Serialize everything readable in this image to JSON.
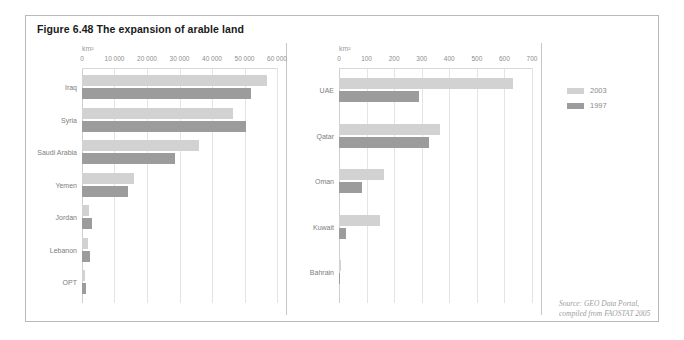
{
  "figure": {
    "title": "Figure 6.48 The expansion of arable land",
    "source_line1": "Source: GEO Data Portal,",
    "source_line2": "compiled from FAOSTAT 2005"
  },
  "legend": {
    "items": [
      {
        "label": "2003",
        "color": "#d2d2d2"
      },
      {
        "label": "1997",
        "color": "#9c9c9c"
      }
    ]
  },
  "chart_data": [
    {
      "type": "bar",
      "orientation": "horizontal",
      "title": "Figure 6.48 The expansion of arable land",
      "panel": "left",
      "xlabel": "km2",
      "unit_label": "km²",
      "ylabel": "",
      "xlim": [
        0,
        60000
      ],
      "ticks": [
        0,
        10000,
        20000,
        30000,
        40000,
        50000,
        60000
      ],
      "tick_labels": [
        "0",
        "10 000",
        "20 000",
        "30 000",
        "40 000",
        "50 000",
        "60 000"
      ],
      "grid": true,
      "legend_position": "right-outside",
      "categories": [
        "Iraq",
        "Syria",
        "Saudi Arabia",
        "Yemen",
        "Jordan",
        "Lebanon",
        "OPT"
      ],
      "series": [
        {
          "name": "2003",
          "color": "#d2d2d2",
          "values": [
            57000,
            46500,
            36000,
            16000,
            2000,
            1800,
            800
          ]
        },
        {
          "name": "1997",
          "color": "#9c9c9c",
          "values": [
            52000,
            50500,
            28500,
            14000,
            3000,
            2500,
            1200
          ]
        }
      ]
    },
    {
      "type": "bar",
      "orientation": "horizontal",
      "panel": "right",
      "xlabel": "km2",
      "unit_label": "km²",
      "ylabel": "",
      "xlim": [
        0,
        700
      ],
      "ticks": [
        0,
        100,
        200,
        300,
        400,
        500,
        600,
        700
      ],
      "tick_labels": [
        "0",
        "100",
        "200",
        "300",
        "400",
        "500",
        "600",
        "700"
      ],
      "grid": true,
      "legend_position": "right-outside",
      "categories": [
        "UAE",
        "Qatar",
        "Oman",
        "Kuwait",
        "Bahrain"
      ],
      "series": [
        {
          "name": "2003",
          "color": "#d2d2d2",
          "values": [
            630,
            365,
            165,
            150,
            6
          ]
        },
        {
          "name": "1997",
          "color": "#9c9c9c",
          "values": [
            290,
            325,
            85,
            25,
            5
          ]
        }
      ]
    }
  ]
}
